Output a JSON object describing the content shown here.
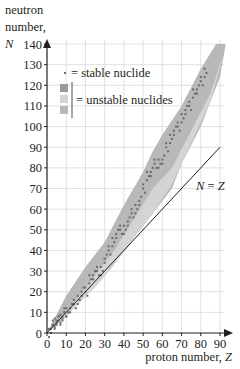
{
  "chart_data": {
    "type": "scatter",
    "title": "",
    "ylabel": {
      "line1": "neutron",
      "line2": "number,",
      "symbol": "N"
    },
    "xlabel": {
      "text": "proton number, ",
      "symbol": "Z"
    },
    "xlim": [
      0,
      90
    ],
    "ylim": [
      0,
      140
    ],
    "xticks": [
      0,
      10,
      20,
      30,
      40,
      50,
      60,
      70,
      80,
      90
    ],
    "yticks": [
      0,
      10,
      20,
      30,
      40,
      50,
      60,
      70,
      80,
      90,
      100,
      110,
      120,
      130,
      140
    ],
    "grid": true,
    "legend": {
      "position": "upper-left",
      "entries": [
        {
          "marker": "dot",
          "label": "= stable nuclide",
          "color": "#6b6b6b"
        },
        {
          "marker": "bracket-3-squares",
          "label": "= unstable nuclides",
          "colors": [
            "#9a9a9a",
            "#d4d4d4",
            "#b8b8b8"
          ]
        }
      ]
    },
    "reference_line": {
      "label_left": "N",
      "label_eq": " = ",
      "label_right": "Z",
      "from": [
        0,
        0
      ],
      "to": [
        90,
        90
      ]
    },
    "series": [
      {
        "name": "unstable nuclides (outer band)",
        "type": "area",
        "color": "#b8b8b8",
        "upper_edge": [
          [
            0,
            0
          ],
          [
            10,
            18
          ],
          [
            20,
            32
          ],
          [
            30,
            44
          ],
          [
            40,
            62
          ],
          [
            50,
            78
          ],
          [
            55,
            88
          ],
          [
            60,
            96
          ],
          [
            70,
            110
          ],
          [
            80,
            128
          ],
          [
            88,
            140
          ]
        ],
        "lower_edge": [
          [
            0,
            0
          ],
          [
            10,
            8
          ],
          [
            20,
            18
          ],
          [
            30,
            28
          ],
          [
            40,
            40
          ],
          [
            50,
            52
          ],
          [
            60,
            64
          ],
          [
            65,
            70
          ],
          [
            70,
            82
          ],
          [
            80,
            100
          ],
          [
            90,
            124
          ],
          [
            93,
            140
          ]
        ]
      },
      {
        "name": "unstable nuclides (inner band)",
        "type": "area",
        "color": "#d4d4d4",
        "upper_edge": [
          [
            5,
            5
          ],
          [
            15,
            16
          ],
          [
            25,
            28
          ],
          [
            35,
            40
          ],
          [
            45,
            55
          ],
          [
            55,
            70
          ],
          [
            65,
            80
          ],
          [
            75,
            98
          ],
          [
            85,
            116
          ],
          [
            90,
            130
          ]
        ],
        "lower_edge": [
          [
            5,
            4
          ],
          [
            15,
            13
          ],
          [
            25,
            22
          ],
          [
            35,
            33
          ],
          [
            45,
            46
          ],
          [
            55,
            58
          ],
          [
            65,
            72
          ],
          [
            75,
            92
          ],
          [
            85,
            112
          ],
          [
            92,
            135
          ]
        ]
      },
      {
        "name": "stable nuclides",
        "type": "scatter",
        "color": "#6b6b6b",
        "points_note": "valley of stability",
        "x": [
          1,
          2,
          3,
          4,
          5,
          6,
          7,
          8,
          9,
          10,
          12,
          14,
          16,
          18,
          20,
          22,
          24,
          26,
          28,
          30,
          32,
          34,
          36,
          38,
          40,
          42,
          44,
          46,
          48,
          50,
          52,
          54,
          56,
          58,
          60,
          62,
          64,
          66,
          68,
          70,
          72,
          74,
          76,
          78,
          80,
          82
        ],
        "y": [
          0,
          2,
          4,
          5,
          6,
          6,
          7,
          8,
          10,
          10,
          12,
          14,
          16,
          20,
          20,
          26,
          28,
          30,
          30,
          36,
          40,
          44,
          48,
          50,
          50,
          54,
          58,
          60,
          64,
          70,
          76,
          78,
          82,
          82,
          84,
          90,
          94,
          98,
          100,
          104,
          108,
          110,
          116,
          118,
          122,
          126
        ]
      }
    ]
  }
}
